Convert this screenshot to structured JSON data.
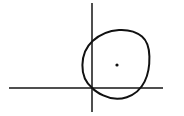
{
  "figure": {
    "kind": "hand-drawn-geometry-sketch",
    "title": "Hand-drawn circle centred in the first quadrant of a coordinate cross",
    "background_color": "#ffffff",
    "ink_color": "#111111",
    "width": 184,
    "height": 116
  },
  "axes": {
    "origin": {
      "x": 92,
      "y": 88
    },
    "stroke_color": "#141414",
    "horizontal": {
      "label": "horizontal axis",
      "x_start": 9,
      "x_end": 163,
      "y": 88,
      "stroke_width": 1.5
    },
    "vertical": {
      "label": "vertical axis",
      "y_start": 3,
      "y_end": 112,
      "x": 92,
      "stroke_width": 1.5
    }
  },
  "circle": {
    "label": "hand-drawn circle",
    "center": {
      "x": 116,
      "y": 64
    },
    "radius": 34,
    "bounds": {
      "left": 82,
      "right": 149,
      "top": 30,
      "bottom": 98
    },
    "stroke_color": "#111111",
    "stroke_width": 2,
    "style": "freehand, slightly irregular and flattened at the top-right",
    "crossings": {
      "horizontal_axis": [
        {
          "x": 92,
          "y": 88
        },
        {
          "x": 143,
          "y": 88
        }
      ],
      "vertical_axis": [
        {
          "x": 92,
          "y": 42
        },
        {
          "x": 92,
          "y": 88
        }
      ]
    },
    "path": "M 92.5 88.2 C 86.0 83.0 82.2 74.5 82.4 65.0 C 82.6 55.5 86.4 46.6 92.6 41.0 C 99.4 34.8 109.0 30.6 119.0 30.0 C 128.0 29.5 136.4 31.8 142.0 36.6 C 147.4 41.2 149.2 48.6 149.4 56.4 C 149.6 65.2 148.4 74.2 144.6 81.6 C 141.0 88.8 134.6 94.6 126.8 97.2 C 119.0 99.8 110.2 98.8 103.2 95.4 C 98.6 93.2 94.9 90.8 92.5 88.2 Z"
  },
  "center_dot": {
    "label": "circle centre marker",
    "x": 117,
    "y": 65,
    "radius": 1.6,
    "fill_color": "#111111"
  }
}
